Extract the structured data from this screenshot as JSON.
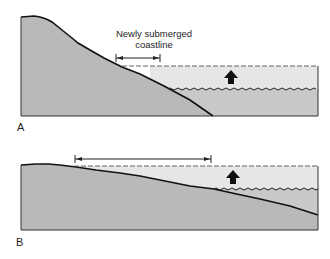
{
  "figure": {
    "panel_a": {
      "label": "A",
      "annotation_line1": "Newly submerged",
      "annotation_line2": "coastline"
    },
    "panel_b": {
      "label": "B"
    }
  },
  "colors": {
    "land": "#b9b9b9",
    "water": "#e6e6e6",
    "outline": "#111111",
    "background": "#ffffff"
  }
}
